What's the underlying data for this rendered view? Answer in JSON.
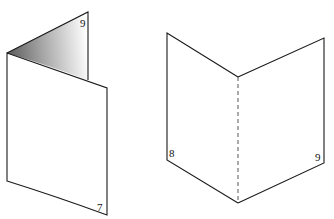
{
  "figures": [
    {
      "name": "folded-sheet-zigzag",
      "page_numbers": {
        "back_flap_top": "9",
        "front_panel_bottom": "7"
      }
    },
    {
      "name": "open-book-v-fold",
      "page_numbers": {
        "left_panel_bottom": "8",
        "right_panel_bottom": "9"
      }
    }
  ],
  "colors": {
    "stroke": "#1a1a1a",
    "shade_dark": "#6a6a6a",
    "shade_light": "#ffffff"
  }
}
